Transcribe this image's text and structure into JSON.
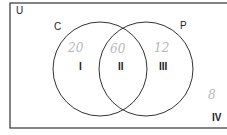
{
  "diagram": {
    "type": "venn",
    "universe_label": "U",
    "sets": [
      {
        "label": "C",
        "region_label": "I",
        "value": "20"
      },
      {
        "label": "P",
        "region_label": "III",
        "value": "12"
      }
    ],
    "intersection": {
      "region_label": "II",
      "value": "60"
    },
    "outside": {
      "region_label": "IV",
      "value": "8"
    }
  },
  "colors": {
    "line": "#333333",
    "handwriting": "#b8b8b8"
  }
}
